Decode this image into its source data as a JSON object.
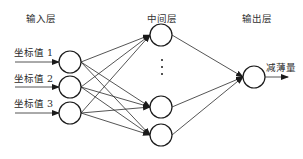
{
  "diagram": {
    "type": "neural-network",
    "layers": {
      "input": {
        "title": "输入层",
        "nodes": [
          "坐标值 1",
          "坐标值 2",
          "坐标值 3"
        ]
      },
      "hidden": {
        "title": "中间层",
        "visible_nodes": 3,
        "ellipsis": "⋮"
      },
      "output": {
        "title": "输出层",
        "nodes": [
          "减薄量"
        ]
      }
    },
    "connections": "fully-connected input→hidden→output",
    "colors": {
      "stroke": "#1a1a1a",
      "background": "#ffffff"
    }
  }
}
